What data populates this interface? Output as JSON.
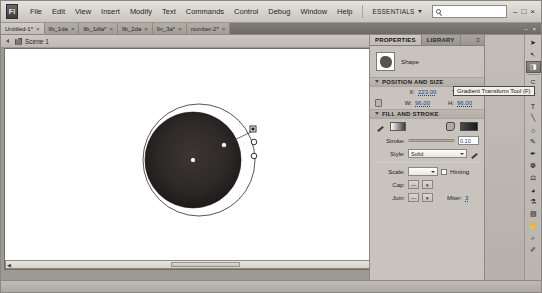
{
  "window": {
    "app_icon_label": "Fl",
    "minimize": "–",
    "maximize": "□",
    "close": "×"
  },
  "menubar": {
    "items": [
      {
        "label": "File"
      },
      {
        "label": "Edit"
      },
      {
        "label": "View"
      },
      {
        "label": "Insert"
      },
      {
        "label": "Modify"
      },
      {
        "label": "Text"
      },
      {
        "label": "Commands"
      },
      {
        "label": "Control"
      },
      {
        "label": "Debug"
      },
      {
        "label": "Window"
      },
      {
        "label": "Help"
      }
    ],
    "workspace": "ESSENTIALS",
    "search_placeholder": "",
    "search_value": ""
  },
  "doc_tabs": {
    "items": [
      {
        "label": "Untitled-1*",
        "close": "×",
        "active": true
      },
      {
        "label": "llb_1da",
        "close": "×",
        "active": false
      },
      {
        "label": "llb_1dla*",
        "close": "×",
        "active": false
      },
      {
        "label": "llb_2da",
        "close": "×",
        "active": false
      },
      {
        "label": "lln_3a*",
        "close": "×",
        "active": false
      },
      {
        "label": "number-2*",
        "close": "×",
        "active": false
      }
    ],
    "right_minimize": "–",
    "right_close": "×"
  },
  "editbar": {
    "scene_label": "Scene 1",
    "zoom_value": "200%"
  },
  "properties": {
    "tabs": [
      {
        "label": "PROPERTIES",
        "active": true
      },
      {
        "label": "LIBRARY",
        "active": false
      }
    ],
    "panel_menu_icon": "≡",
    "object_type": "Shape",
    "sections": {
      "position_and_size": {
        "title": "POSITION AND SIZE",
        "x_label": "X:",
        "x_value": "223.00",
        "y_label": "Y:",
        "y_value": "149.00",
        "w_label": "W:",
        "w_value": "96.00",
        "h_label": "H:",
        "h_value": "96.00"
      },
      "fill_and_stroke": {
        "title": "FILL AND STROKE",
        "stroke_label": "Stroke:",
        "stroke_value": "0.10",
        "style_label": "Style:",
        "style_value": "Solid",
        "scale_label": "Scale:",
        "scale_value": "",
        "hinting_label": "Hinting",
        "cap_label": "Cap:",
        "join_label": "Join:",
        "miter_label": "Miter:",
        "miter_value": "3"
      }
    }
  },
  "tooltip": {
    "text": "Gradient Transform Tool (F)"
  },
  "toolbar": {
    "tools": [
      {
        "name": "selection-tool",
        "glyph": "➤",
        "selected": false
      },
      {
        "name": "subselection-tool",
        "glyph": "↖",
        "selected": false
      },
      {
        "name": "gradient-transform-tool",
        "glyph": "◨",
        "selected": true
      },
      {
        "name": "lasso-tool",
        "glyph": "⊂",
        "selected": false
      },
      {
        "name": "pen-tool",
        "glyph": "✑",
        "selected": false
      },
      {
        "name": "text-tool",
        "glyph": "T",
        "selected": false
      },
      {
        "name": "line-tool",
        "glyph": "╲",
        "selected": false
      },
      {
        "name": "oval-tool",
        "glyph": "○",
        "selected": false
      },
      {
        "name": "pencil-tool",
        "glyph": "✎",
        "selected": false
      },
      {
        "name": "brush-tool",
        "glyph": "✒",
        "selected": false
      },
      {
        "name": "deco-tool",
        "glyph": "❁",
        "selected": false
      },
      {
        "name": "bone-tool",
        "glyph": "⚖",
        "selected": false
      },
      {
        "name": "paint-bucket-tool",
        "glyph": "◕",
        "selected": false
      },
      {
        "name": "eyedropper-tool",
        "glyph": "⚗",
        "selected": false
      },
      {
        "name": "eraser-tool",
        "glyph": "▧",
        "selected": false
      },
      {
        "name": "hand-tool",
        "glyph": "✋",
        "selected": false
      },
      {
        "name": "zoom-tool",
        "glyph": "⌕",
        "selected": false
      },
      {
        "name": "ink-bottle-tool",
        "glyph": "✐",
        "selected": false
      }
    ]
  },
  "canvas": {
    "shape_description": "radial-gradient-filled circle with gradient transform handles",
    "fill_dark": "#332f2e",
    "fill_edge": "#1a1817",
    "overlay_color": "#1e1e1e"
  }
}
